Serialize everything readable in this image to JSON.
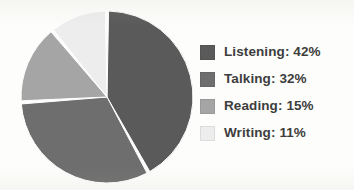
{
  "chart_data": {
    "type": "pie",
    "title": "",
    "categories": [
      "Listening",
      "Talking",
      "Reading",
      "Writing"
    ],
    "values": [
      42,
      32,
      15,
      11
    ],
    "value_unit": "%",
    "legend_position": "right",
    "grid": false,
    "slice_colors": [
      "#5a5a5a",
      "#6e6e6e",
      "#a5a5a5",
      "#ededed"
    ],
    "slice_gap": true,
    "start_angle_deg": 0,
    "direction": "clockwise",
    "labels": [
      "Listening: 42%",
      "Talking: 32%",
      "Reading: 15%",
      "Writing: 11%"
    ]
  },
  "legend": {
    "items": [
      {
        "label": "Listening: 42%",
        "name": "Listening",
        "value": 42,
        "color": "#5a5a5a"
      },
      {
        "label": "Talking: 32%",
        "name": "Talking",
        "value": 32,
        "color": "#6e6e6e"
      },
      {
        "label": "Reading: 15%",
        "name": "Reading",
        "value": 15,
        "color": "#a5a5a5"
      },
      {
        "label": "Writing: 11%",
        "name": "Writing",
        "value": 11,
        "color": "#ededed"
      }
    ]
  },
  "style": {
    "background": "#fdfdfb",
    "text_color": "#3d3d3d",
    "gap_color": "#ffffff"
  }
}
